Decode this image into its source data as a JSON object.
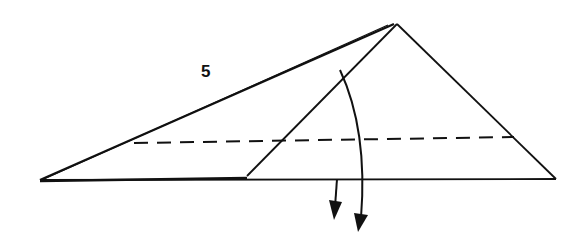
{
  "diagram": {
    "type": "origami-fold-step",
    "step_number": "5",
    "colors": {
      "line": "#111111",
      "background": "#ffffff"
    },
    "elements": [
      "outer-triangle",
      "inner-flap-edge",
      "valley-fold-dashed-line",
      "fold-down-arrow-short",
      "fold-down-arrow-curved"
    ]
  }
}
